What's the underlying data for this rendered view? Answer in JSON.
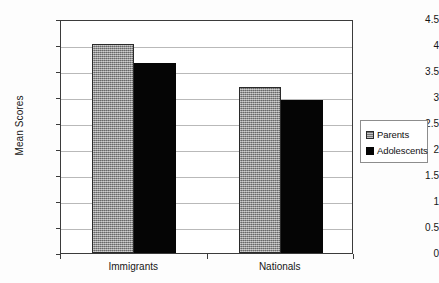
{
  "chart_data": {
    "type": "bar",
    "title": "",
    "xlabel": "",
    "ylabel": "Mean Scores",
    "categories": [
      "Immigrants",
      "Nationals"
    ],
    "series": [
      {
        "name": "Parents",
        "values": [
          4.02,
          3.2
        ],
        "color": "#8a8a8a",
        "pattern": "hatched-gray"
      },
      {
        "name": "Adolescents",
        "values": [
          3.65,
          2.95
        ],
        "color": "#050505",
        "pattern": "solid-black"
      }
    ],
    "ylim": [
      0,
      4.5
    ],
    "ytick_labels": [
      "0",
      "0.5",
      "1",
      "1.5",
      "2",
      "2.5",
      "3",
      "3.5",
      "4",
      "4.5"
    ],
    "ytick_values": [
      0,
      0.5,
      1,
      1.5,
      2,
      2.5,
      3,
      3.5,
      4,
      4.5
    ],
    "grid": true,
    "legend_position": "right"
  },
  "legend": {
    "entries": [
      {
        "label": "Parents"
      },
      {
        "label": "Adolescents"
      }
    ]
  }
}
